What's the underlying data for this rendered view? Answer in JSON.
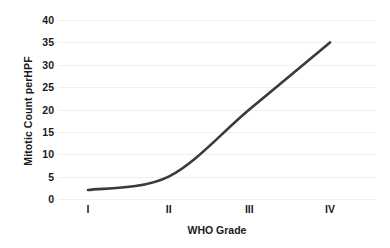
{
  "chart_data": {
    "type": "line",
    "title": "",
    "xlabel": "WHO Grade",
    "ylabel": "Mitotic Count perHPF",
    "categories": [
      "I",
      "II",
      "III",
      "IV"
    ],
    "x": [
      1,
      2,
      3,
      4
    ],
    "values": [
      2,
      5,
      20,
      35
    ],
    "series": [
      {
        "name": "Mitotic Count perHPF",
        "values": [
          2,
          5,
          20,
          35
        ],
        "color": "#3a3a3a",
        "line_width": 2.6,
        "smooth": true,
        "markers": false
      }
    ],
    "ylim": [
      0,
      40
    ],
    "yticks": [
      0,
      5,
      10,
      15,
      20,
      25,
      30,
      35,
      40
    ],
    "ytick_labels": [
      "0",
      "5",
      "10",
      "15",
      "20",
      "25",
      "30",
      "35",
      "40"
    ],
    "xtick_labels": [
      "I",
      "II",
      "III",
      "IV"
    ],
    "grid": true,
    "grid_axis": "y",
    "grid_color": "#efefef",
    "legend": false,
    "legend_position": "none",
    "background": "#ffffff",
    "annotations": []
  }
}
